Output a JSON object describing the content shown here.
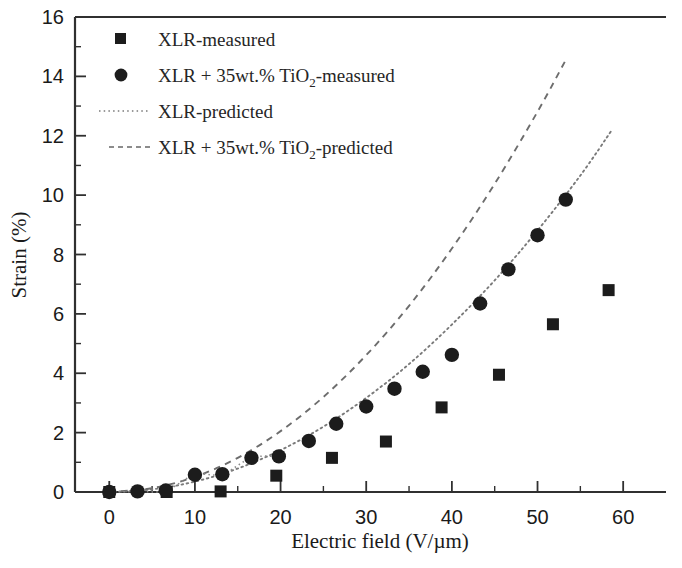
{
  "chart_data": {
    "type": "scatter",
    "title": "",
    "xlabel": "Electric field (V/µm)",
    "ylabel": "Strain (%)",
    "xlim": [
      -4,
      65
    ],
    "ylim": [
      0,
      16
    ],
    "xticks": [
      0,
      10,
      20,
      30,
      40,
      50,
      60
    ],
    "yticks": [
      0,
      2,
      4,
      6,
      8,
      10,
      12,
      14,
      16
    ],
    "xtick_labels": [
      "0",
      "10",
      "20",
      "30",
      "40",
      "50",
      "60"
    ],
    "ytick_labels": [
      "0",
      "2",
      "4",
      "6",
      "8",
      "10",
      "12",
      "14",
      "16"
    ],
    "minor_ticks_per_interval": 1,
    "grid": false,
    "legend_position": "upper-left",
    "series": [
      {
        "name": "XLR-measured",
        "marker": "square",
        "style": "markers",
        "color": "#1c1c1c",
        "points": [
          {
            "x": 0.0,
            "y": 0.0
          },
          {
            "x": 6.7,
            "y": 0.0
          },
          {
            "x": 13.0,
            "y": 0.02
          },
          {
            "x": 19.5,
            "y": 0.55
          },
          {
            "x": 26.0,
            "y": 1.15
          },
          {
            "x": 32.3,
            "y": 1.7
          },
          {
            "x": 38.8,
            "y": 2.85
          },
          {
            "x": 45.5,
            "y": 3.95
          },
          {
            "x": 51.8,
            "y": 5.65
          },
          {
            "x": 58.3,
            "y": 6.8
          }
        ]
      },
      {
        "name": "XLR + 35wt.% TiO2-measured",
        "marker": "circle",
        "style": "markers",
        "color": "#1c1c1c",
        "points": [
          {
            "x": 0.0,
            "y": 0.0
          },
          {
            "x": 3.3,
            "y": 0.02
          },
          {
            "x": 6.6,
            "y": 0.05
          },
          {
            "x": 10.0,
            "y": 0.58
          },
          {
            "x": 13.2,
            "y": 0.6
          },
          {
            "x": 16.6,
            "y": 1.15
          },
          {
            "x": 19.8,
            "y": 1.2
          },
          {
            "x": 23.3,
            "y": 1.72
          },
          {
            "x": 26.5,
            "y": 2.3
          },
          {
            "x": 30.0,
            "y": 2.88
          },
          {
            "x": 33.3,
            "y": 3.48
          },
          {
            "x": 36.6,
            "y": 4.05
          },
          {
            "x": 40.0,
            "y": 4.62
          },
          {
            "x": 43.3,
            "y": 6.35
          },
          {
            "x": 46.6,
            "y": 7.5
          },
          {
            "x": 50.0,
            "y": 8.65
          },
          {
            "x": 53.3,
            "y": 9.85
          }
        ]
      },
      {
        "name": "XLR-predicted",
        "marker": "none",
        "style": "dotted-line",
        "color": "#7a7a7a",
        "points": [
          {
            "x": 0.0,
            "y": 0.0
          },
          {
            "x": 5.0,
            "y": 0.09
          },
          {
            "x": 10.0,
            "y": 0.35
          },
          {
            "x": 15.0,
            "y": 0.79
          },
          {
            "x": 20.0,
            "y": 1.41
          },
          {
            "x": 25.0,
            "y": 2.2
          },
          {
            "x": 30.0,
            "y": 3.17
          },
          {
            "x": 35.0,
            "y": 4.31
          },
          {
            "x": 40.0,
            "y": 5.64
          },
          {
            "x": 45.0,
            "y": 7.13
          },
          {
            "x": 50.0,
            "y": 8.81
          },
          {
            "x": 55.0,
            "y": 10.66
          },
          {
            "x": 58.7,
            "y": 12.2
          }
        ]
      },
      {
        "name": "XLR + 35wt.% TiO2-predicted",
        "marker": "none",
        "style": "dashed-line",
        "color": "#6d6d6d",
        "points": [
          {
            "x": 0.0,
            "y": 0.0
          },
          {
            "x": 5.0,
            "y": 0.13
          },
          {
            "x": 10.0,
            "y": 0.51
          },
          {
            "x": 15.0,
            "y": 1.15
          },
          {
            "x": 20.0,
            "y": 2.05
          },
          {
            "x": 25.0,
            "y": 3.2
          },
          {
            "x": 30.0,
            "y": 4.61
          },
          {
            "x": 35.0,
            "y": 6.27
          },
          {
            "x": 40.0,
            "y": 8.2
          },
          {
            "x": 45.0,
            "y": 10.38
          },
          {
            "x": 50.0,
            "y": 12.81
          },
          {
            "x": 53.2,
            "y": 14.5
          }
        ]
      }
    ]
  },
  "legend": {
    "items": [
      {
        "label": "XLR-measured",
        "marker": "square",
        "sub": "",
        "tail": ""
      },
      {
        "label": "XLR + 35wt.% TiO",
        "marker": "circle",
        "sub": "2",
        "tail": "-measured"
      },
      {
        "label": "XLR-predicted",
        "marker": "dotted",
        "sub": "",
        "tail": ""
      },
      {
        "label": "XLR + 35wt.% TiO",
        "marker": "dashed",
        "sub": "2",
        "tail": "-predicted"
      }
    ]
  },
  "axes": {
    "x_title": "Electric field (V/µm)",
    "y_title": "Strain (%)"
  }
}
